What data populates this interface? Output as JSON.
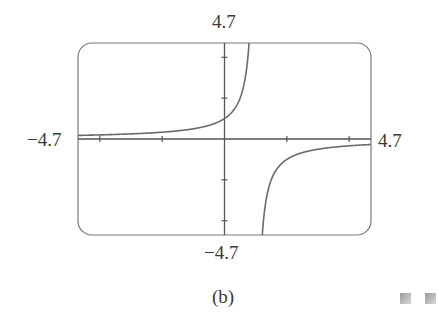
{
  "chart_data": {
    "type": "line",
    "title": "",
    "xlabel": "",
    "ylabel": "",
    "xlim": [
      -4.7,
      4.7
    ],
    "ylim": [
      -4.7,
      4.7
    ],
    "x_tick_positions": [
      -4,
      -2,
      2,
      4
    ],
    "y_tick_positions": [
      -4,
      -2,
      2,
      4
    ],
    "grid": false,
    "function": "y = 1/(1 - x)",
    "vertical_asymptote": 1,
    "horizontal_asymptote": 0,
    "series": [
      {
        "name": "left branch",
        "x": [
          -4.7,
          -4,
          -3,
          -2,
          -1,
          0,
          0.5,
          0.787
        ],
        "y": [
          0.18,
          0.2,
          0.25,
          0.33,
          0.5,
          1,
          2,
          4.7
        ]
      },
      {
        "name": "right branch",
        "x": [
          1.213,
          1.5,
          2,
          3,
          4,
          4.7
        ],
        "y": [
          -4.7,
          -2,
          -1,
          -0.5,
          -0.33,
          -0.27
        ]
      }
    ],
    "axis_labels": {
      "top": "4.7",
      "bottom": "−4.7",
      "left": "−4.7",
      "right": "4.7"
    },
    "caption": "(b)"
  },
  "colors": {
    "frame": "#7a7a7a",
    "axes": "#555555",
    "curve": "#6a6a6a"
  }
}
